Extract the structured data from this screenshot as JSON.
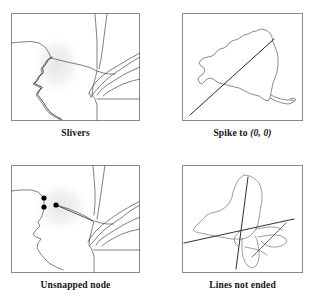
{
  "figure": {
    "panel_count": 4,
    "background_color": "#ffffff",
    "frame_color": "#8b8b8b",
    "line_color": "#4a4a4a",
    "error_line_color": "#1a1a1a",
    "node_color": "#000000",
    "highlight_color": "#ececec"
  },
  "panels": [
    {
      "id": "slivers",
      "caption": "Slivers",
      "caption_parts": {
        "main": "Slivers",
        "parenthetical": ""
      },
      "subject": "state-boundary-map-with-duplicate-offset-boundary",
      "error_type": "sliver-polygons",
      "annotation": "duplicated boundary line creating thin sliver polygons",
      "highlight": {
        "cx": 46,
        "cy": 52,
        "rx": 25,
        "ry": 30
      }
    },
    {
      "id": "spike",
      "caption": "Spike to (0, 0)",
      "caption_parts": {
        "main": "Spike to ",
        "parenthetical": "(0, 0)"
      },
      "subject": "new-york-state-outline",
      "error_type": "spike-to-origin",
      "annotation": "long straight spike running to the map origin at lower-left corner",
      "spike": {
        "from_x": 8,
        "from_y": 102,
        "to_x": 92,
        "to_y": 26
      }
    },
    {
      "id": "unsnapped",
      "caption": "Unsnapped node",
      "caption_parts": {
        "main": "Unsnapped node",
        "parenthetical": ""
      },
      "subject": "state-boundary-map-with-dangling-nodes",
      "error_type": "unsnapped-node",
      "annotation": "node endpoints that fail to coincide, leaving a gap",
      "highlight": {
        "cx": 50,
        "cy": 42,
        "rx": 28,
        "ry": 26
      },
      "nodes": [
        {
          "x": 33,
          "y": 33,
          "r": 2.6
        },
        {
          "x": 33,
          "y": 42,
          "r": 2.6
        },
        {
          "x": 45,
          "y": 40,
          "r": 2.6
        }
      ]
    },
    {
      "id": "lines-not-ended",
      "caption": "Lines not ended",
      "caption_parts": {
        "main": "Lines not ended",
        "parenthetical": ""
      },
      "subject": "new-england-states-outline",
      "error_type": "overshoot-undershoot",
      "annotation": "digitized lines overshoot past their intended endpoints",
      "overshoots": [
        {
          "from_x": 2,
          "from_y": 78,
          "to_x": 112,
          "to_y": 54
        },
        {
          "from_x": 66,
          "from_y": 12,
          "to_x": 54,
          "to_y": 104
        }
      ]
    }
  ]
}
